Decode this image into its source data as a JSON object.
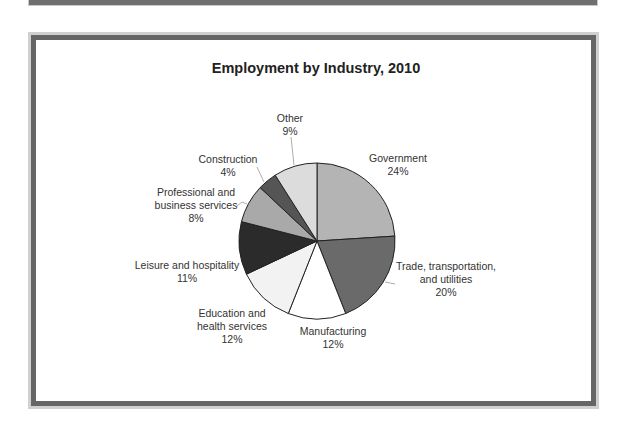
{
  "chart_data": {
    "type": "pie",
    "title": "Employment by Industry, 2010",
    "categories": [
      "Government",
      "Trade, transportation, and utilities",
      "Manufacturing",
      "Education and health services",
      "Leisure and hospitality",
      "Professional and business services",
      "Construction",
      "Other"
    ],
    "values": [
      24,
      20,
      12,
      12,
      11,
      8,
      4,
      9
    ],
    "unit": "%",
    "colors": [
      "#b4b4b4",
      "#6a6a6a",
      "#ffffff",
      "#f2f2f2",
      "#2b2b2b",
      "#a9a9a9",
      "#555555",
      "#dcdcdc"
    ],
    "start_angle": "12 o'clock, clockwise",
    "legend": "none (data labels with leader lines)"
  },
  "labels": {
    "government": [
      "Government",
      "24%"
    ],
    "trade": [
      "Trade, transportation,",
      "and utilities",
      "20%"
    ],
    "manufacturing": [
      "Manufacturing",
      "12%"
    ],
    "education": [
      "Education and",
      "health services",
      "12%"
    ],
    "leisure": [
      "Leisure and hospitality",
      "11%"
    ],
    "professional": [
      "Professional and",
      "business services",
      "8%"
    ],
    "construction": [
      "Construction",
      "4%"
    ],
    "other": [
      "Other",
      "9%"
    ]
  }
}
